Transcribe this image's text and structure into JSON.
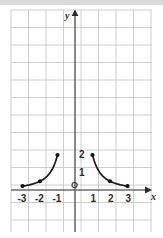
{
  "figure": {
    "width": 163,
    "height": 238,
    "background": "#ffffff",
    "top_band_color": "#d9d9d9"
  },
  "chart_data": {
    "type": "line",
    "title": "",
    "xlabel": "x",
    "ylabel": "y",
    "xlim": [
      -3.65,
      4.4
    ],
    "ylim": [
      -2.4,
      10.2
    ],
    "grid": true,
    "grid_color": "#c8c8c8",
    "grid_spacing": 1,
    "axis_color": "#6b6b6b",
    "curve_color": "#1c1c1c",
    "legend": "none",
    "origin_label": "O",
    "xticks": [
      -3,
      -2,
      -1,
      1,
      2,
      3
    ],
    "xtick_labels": [
      "-3",
      "-2",
      "-1",
      "1",
      "2",
      "3"
    ],
    "yticks": [
      1,
      2
    ],
    "ytick_labels": [
      "1",
      "2"
    ],
    "series": [
      {
        "name": "left-branch",
        "endpoint_markers": [
          {
            "x": -1,
            "y": 2
          },
          {
            "x": -2,
            "y": 0.5
          },
          {
            "x": -3,
            "y": 0.222
          }
        ],
        "points": [
          {
            "x": -1.0,
            "y": 2.0
          },
          {
            "x": -1.1,
            "y": 1.653
          },
          {
            "x": -1.2,
            "y": 1.389
          },
          {
            "x": -1.3,
            "y": 1.183
          },
          {
            "x": -1.4,
            "y": 1.02
          },
          {
            "x": -1.5,
            "y": 0.889
          },
          {
            "x": -1.6,
            "y": 0.781
          },
          {
            "x": -1.7,
            "y": 0.692
          },
          {
            "x": -1.8,
            "y": 0.617
          },
          {
            "x": -1.9,
            "y": 0.554
          },
          {
            "x": -2.0,
            "y": 0.5
          },
          {
            "x": -2.2,
            "y": 0.413
          },
          {
            "x": -2.4,
            "y": 0.347
          },
          {
            "x": -2.6,
            "y": 0.296
          },
          {
            "x": -2.8,
            "y": 0.255
          },
          {
            "x": -3.0,
            "y": 0.222
          }
        ]
      },
      {
        "name": "right-branch",
        "endpoint_markers": [
          {
            "x": 1,
            "y": 2
          },
          {
            "x": 2,
            "y": 0.5
          },
          {
            "x": 3,
            "y": 0.222
          }
        ],
        "points": [
          {
            "x": 1.0,
            "y": 2.0
          },
          {
            "x": 1.1,
            "y": 1.653
          },
          {
            "x": 1.2,
            "y": 1.389
          },
          {
            "x": 1.3,
            "y": 1.183
          },
          {
            "x": 1.4,
            "y": 1.02
          },
          {
            "x": 1.5,
            "y": 0.889
          },
          {
            "x": 1.6,
            "y": 0.781
          },
          {
            "x": 1.7,
            "y": 0.692
          },
          {
            "x": 1.8,
            "y": 0.617
          },
          {
            "x": 1.9,
            "y": 0.554
          },
          {
            "x": 2.0,
            "y": 0.5
          },
          {
            "x": 2.2,
            "y": 0.413
          },
          {
            "x": 2.4,
            "y": 0.347
          },
          {
            "x": 2.6,
            "y": 0.296
          },
          {
            "x": 2.8,
            "y": 0.255
          },
          {
            "x": 3.0,
            "y": 0.222
          }
        ]
      }
    ]
  },
  "labels": {
    "x_axis_letter": "x",
    "y_axis_letter": "y",
    "origin": "O",
    "x_neg3": "-3",
    "x_neg2": "-2",
    "x_neg1": "-1",
    "x_pos1": "1",
    "x_pos2": "2",
    "x_pos3": "3",
    "y_1": "1",
    "y_2": "2"
  }
}
